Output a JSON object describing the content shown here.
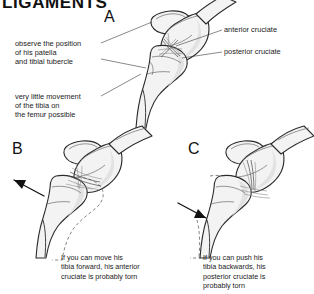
{
  "figure": {
    "title": "LIGAMENTS",
    "panels": [
      {
        "letter": "A",
        "name": "panel-a-normal-knee",
        "description": "Normal knee in profile showing patella, femoral condyle and tibia with intact anterior and posterior cruciate ligaments crossing in the joint space",
        "labels": [
          {
            "name": "anterior-cruciate",
            "text": "anterior cruciate"
          },
          {
            "name": "posterior-cruciate",
            "text": "posterior cruciate"
          }
        ],
        "notes": [
          {
            "name": "observe-position-note",
            "text": "observe the position\nof his patella\nand tibial tubercle"
          },
          {
            "name": "little-movement-note",
            "text": "very little movement\nof the tibia on\nthe femur possible"
          }
        ]
      },
      {
        "letter": "B",
        "name": "panel-b-anterior-drawer",
        "description": "Tibia pulled forward relative to the femur, arrow pointing forward, dashed ghost outline marking the original tibial position",
        "caption": "If you can move his\ntibia forward, his anterior\ncruciate is probably torn",
        "arrow_direction": "forward-left"
      },
      {
        "letter": "C",
        "name": "panel-c-posterior-drawer",
        "description": "Tibia pushed backwards relative to the femur, arrow pointing backwards, dashed ghost outline marking the original tibial position",
        "caption": "If you can push his\ntibia backwards, his\nposterior cruciate is\nprobably torn",
        "arrow_direction": "backward-right"
      }
    ]
  },
  "colors": {
    "background": "#ffffff",
    "ink": "#1a1a1a",
    "bone_outline": "#2b2b2b",
    "bone_fill": "#f3f3f3",
    "bone_shade": "#e2e2e2",
    "ligament": "#565656",
    "ghost_outline": "#707070",
    "arrow": "#111111"
  }
}
